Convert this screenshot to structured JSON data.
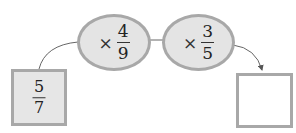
{
  "diagram": {
    "type": "fraction-multiplication-chain",
    "start": {
      "numerator": "5",
      "denominator": "7"
    },
    "operations": [
      {
        "operator": "×",
        "numerator": "4",
        "denominator": "9"
      },
      {
        "operator": "×",
        "numerator": "3",
        "denominator": "5"
      }
    ],
    "answer": {
      "value": ""
    },
    "colors": {
      "box_fill": "#e6e6e6",
      "oval_fill": "#e4e4e4",
      "border": "#a8a8a8",
      "connector": "#555555",
      "answer_fill": "#ffffff"
    }
  }
}
